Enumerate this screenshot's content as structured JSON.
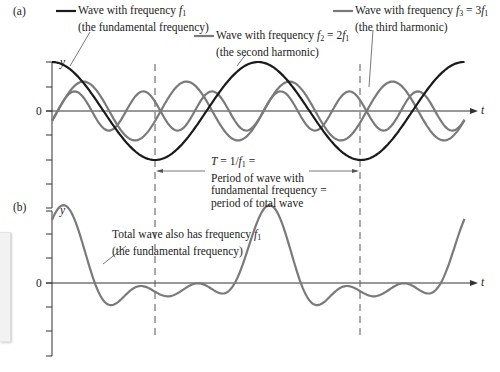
{
  "panels": {
    "a": {
      "label": "(a)",
      "y_axis_label": "y",
      "x_axis_label": "t",
      "zero_label": "0",
      "legend": [
        {
          "line1": "Wave with frequency f1",
          "line2": "(the fundamental frequency)",
          "color": "#1a1a1a"
        },
        {
          "line1": "Wave with frequency f2 = 2f1",
          "line2": "(the second harmonic)",
          "color": "#7a7a7a"
        },
        {
          "line1": "Wave with frequency f3 = 3f1",
          "line2": "(the third harmonic)",
          "color": "#7a7a7a"
        }
      ],
      "period_annotation": [
        "T = 1/f1 =",
        "Period of wave with",
        "fundamental frequency =",
        "period of total wave"
      ]
    },
    "b": {
      "label": "(b)",
      "y_axis_label": "y",
      "x_axis_label": "t",
      "zero_label": "0",
      "annotation": [
        "Total wave also has frequency f1",
        "(the fundamental frequency)"
      ]
    }
  },
  "chart_data": [
    {
      "type": "line",
      "title": "(a) Fundamental and harmonics",
      "xlabel": "t",
      "ylabel": "y",
      "grid": false,
      "x_units": "periods of fundamental (T)",
      "series": [
        {
          "name": "f1 (fundamental)",
          "amplitude": 2.0,
          "frequency_multiple": 1,
          "phase": "cos, max at t=0",
          "color": "#1a1a1a"
        },
        {
          "name": "f2 = 2f1 (second harmonic)",
          "amplitude": 1.2,
          "frequency_multiple": 2,
          "color": "#7a7a7a"
        },
        {
          "name": "f3 = 3f1 (third harmonic)",
          "amplitude": 0.8,
          "frequency_multiple": 3,
          "color": "#7a7a7a"
        }
      ],
      "y_ticks": 7,
      "x_range_periods": [
        0,
        2.0
      ],
      "period_marker": {
        "from": 0.5,
        "to": 1.5,
        "label": "T = 1/f1"
      }
    },
    {
      "type": "line",
      "title": "(b) Total wave",
      "xlabel": "t",
      "ylabel": "y",
      "grid": false,
      "series": [
        {
          "name": "total wave (sum)",
          "color": "#7a7a7a",
          "frequency": "f1"
        }
      ],
      "y_ticks": 7,
      "x_range_periods": [
        0,
        2.0
      ]
    }
  ],
  "colors": {
    "fundamental": "#1a1a1a",
    "harmonic": "#7a7a7a",
    "axis": "#333333",
    "dash": "#555555"
  }
}
